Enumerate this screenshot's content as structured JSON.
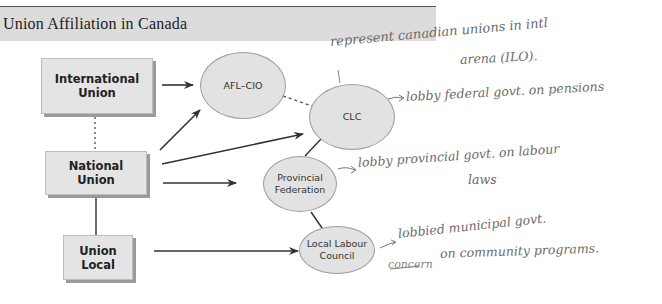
{
  "header": {
    "title": "Union Affiliation in Canada"
  },
  "diagram": {
    "nodes": {
      "international_union": "International Union",
      "national_union": "National Union",
      "union_local": "Union Local",
      "afl_cio": "AFL–CIO",
      "clc": "CLC",
      "provincial_federation": "Provincial Federation",
      "local_labour_council": "Local Labour Council"
    },
    "edges": [
      {
        "from": "International Union",
        "to": "AFL–CIO",
        "style": "arrow"
      },
      {
        "from": "International Union",
        "to": "National Union",
        "style": "dotted"
      },
      {
        "from": "National Union",
        "to": "AFL–CIO",
        "style": "arrow"
      },
      {
        "from": "National Union",
        "to": "CLC",
        "style": "arrow"
      },
      {
        "from": "National Union",
        "to": "Provincial Federation",
        "style": "arrow"
      },
      {
        "from": "National Union",
        "to": "Union Local",
        "style": "solid"
      },
      {
        "from": "AFL–CIO",
        "to": "CLC",
        "style": "dashed"
      },
      {
        "from": "CLC",
        "to": "Provincial Federation",
        "style": "solid"
      },
      {
        "from": "Provincial Federation",
        "to": "Local Labour Council",
        "style": "solid"
      },
      {
        "from": "Union Local",
        "to": "Local Labour Council",
        "style": "arrow"
      }
    ],
    "colors": {
      "node_fill": "#e2e2e2",
      "node_border": "#9c9c9c",
      "line": "#333333",
      "header_band": "#dcdcdc",
      "handwriting": "#6a6a6a"
    }
  },
  "annotations": {
    "clc_top_line1": "represent canadian unions in intl",
    "clc_top_line2": "arena (ILO).",
    "clc_right": "lobby federal govt. on pensions",
    "provincial_line1": "lobby provincial govt. on labour",
    "provincial_line2": "laws",
    "local_line1": "lobbied municipal govt.",
    "local_line2": "on community programs.",
    "local_crossed": "concern"
  }
}
